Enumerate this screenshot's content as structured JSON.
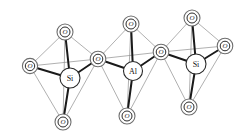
{
  "figure": {
    "name": "silicate-aluminate-tetrahedra-chain",
    "background_color": "#ffffff",
    "bond_color": "#1a1a1a",
    "edge_color": "#8e8e8e",
    "atom_outline_color": "#6e6e6e"
  },
  "labels": {
    "oxygen": "O",
    "silicon": "Si",
    "aluminium": "Al"
  },
  "atoms": {
    "oxygens": [
      {
        "id": "o-left-apex-top",
        "label": "O",
        "cx": 65,
        "cy": 32,
        "r_outer": 8.0,
        "r_inner": 5.0
      },
      {
        "id": "o-left-outer",
        "label": "O",
        "cx": 30,
        "cy": 66,
        "r_outer": 7.6,
        "r_inner": 4.7
      },
      {
        "id": "o-left-bottom",
        "label": "O",
        "cx": 63,
        "cy": 122,
        "r_outer": 8.0,
        "r_inner": 5.0
      },
      {
        "id": "o-bridge-left",
        "label": "O",
        "cx": 98,
        "cy": 59,
        "r_outer": 7.8,
        "r_inner": 4.8
      },
      {
        "id": "o-mid-apex-top",
        "label": "O",
        "cx": 131,
        "cy": 24,
        "r_outer": 8.0,
        "r_inner": 5.0
      },
      {
        "id": "o-mid-bottom",
        "label": "O",
        "cx": 127,
        "cy": 116,
        "r_outer": 8.0,
        "r_inner": 5.0
      },
      {
        "id": "o-bridge-right",
        "label": "O",
        "cx": 161,
        "cy": 52,
        "r_outer": 7.8,
        "r_inner": 4.8
      },
      {
        "id": "o-right-apex-top",
        "label": "O",
        "cx": 192,
        "cy": 18,
        "r_outer": 8.0,
        "r_inner": 5.0
      },
      {
        "id": "o-right-outer",
        "label": "O",
        "cx": 225,
        "cy": 46,
        "r_outer": 7.8,
        "r_inner": 4.8
      },
      {
        "id": "o-right-bottom",
        "label": "O",
        "cx": 189,
        "cy": 107,
        "r_outer": 8.0,
        "r_inner": 5.0
      }
    ],
    "cations": [
      {
        "id": "cation-si-left",
        "label": "Si",
        "cx": 70,
        "cy": 78,
        "r": 10.0
      },
      {
        "id": "cation-al-mid",
        "label": "Al",
        "cx": 133,
        "cy": 71,
        "r": 9.5
      },
      {
        "id": "cation-si-right",
        "label": "Si",
        "cx": 196,
        "cy": 64,
        "r": 10.0
      }
    ]
  },
  "bonds": {
    "strong": [
      {
        "from": "cation-si-left",
        "to": "o-left-apex-top",
        "width": 2.0
      },
      {
        "from": "cation-si-left",
        "to": "o-left-outer",
        "width": 1.9
      },
      {
        "from": "cation-si-left",
        "to": "o-left-bottom",
        "width": 2.0
      },
      {
        "from": "cation-si-left",
        "to": "o-bridge-left",
        "width": 1.9
      },
      {
        "from": "cation-al-mid",
        "to": "o-mid-apex-top",
        "width": 2.0
      },
      {
        "from": "cation-al-mid",
        "to": "o-bridge-left",
        "width": 1.9
      },
      {
        "from": "cation-al-mid",
        "to": "o-mid-bottom",
        "width": 2.0
      },
      {
        "from": "cation-al-mid",
        "to": "o-bridge-right",
        "width": 1.9
      },
      {
        "from": "cation-si-right",
        "to": "o-right-apex-top",
        "width": 2.0
      },
      {
        "from": "cation-si-right",
        "to": "o-bridge-right",
        "width": 1.9
      },
      {
        "from": "cation-si-right",
        "to": "o-right-bottom",
        "width": 2.0
      },
      {
        "from": "cation-si-right",
        "to": "o-right-outer",
        "width": 1.9
      }
    ],
    "tetrahedron_edges": [
      {
        "from": "o-left-apex-top",
        "to": "o-left-outer"
      },
      {
        "from": "o-left-apex-top",
        "to": "o-bridge-left"
      },
      {
        "from": "o-left-apex-top",
        "to": "o-left-bottom"
      },
      {
        "from": "o-left-outer",
        "to": "o-bridge-left"
      },
      {
        "from": "o-left-outer",
        "to": "o-left-bottom"
      },
      {
        "from": "o-bridge-left",
        "to": "o-left-bottom"
      },
      {
        "from": "o-mid-apex-top",
        "to": "o-bridge-left"
      },
      {
        "from": "o-mid-apex-top",
        "to": "o-bridge-right"
      },
      {
        "from": "o-mid-apex-top",
        "to": "o-mid-bottom"
      },
      {
        "from": "o-bridge-left",
        "to": "o-bridge-right"
      },
      {
        "from": "o-bridge-left",
        "to": "o-mid-bottom"
      },
      {
        "from": "o-bridge-right",
        "to": "o-mid-bottom"
      },
      {
        "from": "o-right-apex-top",
        "to": "o-bridge-right"
      },
      {
        "from": "o-right-apex-top",
        "to": "o-right-outer"
      },
      {
        "from": "o-right-apex-top",
        "to": "o-right-bottom"
      },
      {
        "from": "o-bridge-right",
        "to": "o-right-outer"
      },
      {
        "from": "o-bridge-right",
        "to": "o-right-bottom"
      },
      {
        "from": "o-right-outer",
        "to": "o-right-bottom"
      }
    ]
  }
}
